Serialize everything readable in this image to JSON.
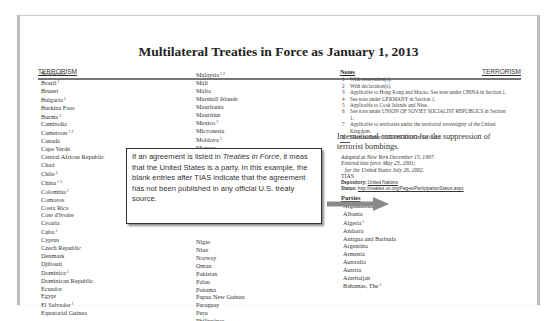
{
  "document": {
    "title": "Multilateral Treaties in Force as January 1, 2013",
    "running_head_left": "TERRORISM",
    "running_head_right": "TERRORISM"
  },
  "left_column": [
    {
      "name": "Botswana",
      "sup": ""
    },
    {
      "name": "Brazil",
      "sup": "1"
    },
    {
      "name": "Brunei",
      "sup": ""
    },
    {
      "name": "Bulgaria",
      "sup": "2"
    },
    {
      "name": "Burkina Faso",
      "sup": ""
    },
    {
      "name": "Burma",
      "sup": "1"
    },
    {
      "name": "Cambodia",
      "sup": ""
    },
    {
      "name": "Cameroon",
      "sup": "1 2"
    },
    {
      "name": "Canada",
      "sup": ""
    },
    {
      "name": "Cape Verde",
      "sup": ""
    },
    {
      "name": "Central African Republic",
      "sup": ""
    },
    {
      "name": "Chad",
      "sup": ""
    },
    {
      "name": "Chile",
      "sup": "2"
    },
    {
      "name": "China",
      "sup": "1 3"
    },
    {
      "name": "Colombia",
      "sup": "1"
    },
    {
      "name": "Comoros",
      "sup": ""
    },
    {
      "name": "Costa Rica",
      "sup": ""
    },
    {
      "name": "Cote d'Ivoire",
      "sup": ""
    },
    {
      "name": "Croatia",
      "sup": ""
    },
    {
      "name": "Cuba",
      "sup": "1"
    },
    {
      "name": "Cyprus",
      "sup": ""
    },
    {
      "name": "Czech Republic",
      "sup": ""
    },
    {
      "name": "Denmark",
      "sup": ""
    },
    {
      "name": "Djibouti",
      "sup": ""
    },
    {
      "name": "Dominica",
      "sup": "2"
    },
    {
      "name": "Dominican Republic",
      "sup": ""
    },
    {
      "name": "Ecuador",
      "sup": ""
    },
    {
      "name": "Egypt",
      "sup": ""
    },
    {
      "name": "El Salvador",
      "sup": "1"
    },
    {
      "name": "Equatorial Guinea",
      "sup": ""
    }
  ],
  "middle_column_top": [
    {
      "name": "Malaysia",
      "sup": "1 2"
    },
    {
      "name": "Mali",
      "sup": ""
    },
    {
      "name": "Malta",
      "sup": ""
    },
    {
      "name": "Marshall Islands",
      "sup": ""
    },
    {
      "name": "Mauritania",
      "sup": ""
    },
    {
      "name": "Mauritius",
      "sup": ""
    },
    {
      "name": "Mexico",
      "sup": "2"
    },
    {
      "name": "Micronesia",
      "sup": ""
    },
    {
      "name": "Moldova",
      "sup": "1"
    },
    {
      "name": "Monaco",
      "sup": ""
    }
  ],
  "middle_column_bottom": [
    {
      "name": "Niger",
      "sup": ""
    },
    {
      "name": "Niue",
      "sup": ""
    },
    {
      "name": "Norway",
      "sup": ""
    },
    {
      "name": "Oman",
      "sup": ""
    },
    {
      "name": "Pakistan",
      "sup": ""
    },
    {
      "name": "Palau",
      "sup": ""
    },
    {
      "name": "Panama",
      "sup": ""
    },
    {
      "name": "Papua New Guinea",
      "sup": ""
    },
    {
      "name": "Paraguay",
      "sup": ""
    },
    {
      "name": "Peru",
      "sup": ""
    },
    {
      "name": "Philippines",
      "sup": ""
    }
  ],
  "notes": {
    "heading": "Notes",
    "items": [
      {
        "num": "1",
        "text": "With reservation(s)."
      },
      {
        "num": "2",
        "text": "With declaration(s)."
      },
      {
        "num": "3",
        "text": "Applicable to Hong Kong and Macao. See note under CHINA in Section 1."
      },
      {
        "num": "4",
        "text": "See note under GERMANY in Section 1."
      },
      {
        "num": "5",
        "text": "Applicable to Cook Islands and Niue."
      },
      {
        "num": "6",
        "text": "See note under UNION OF SOVIET SOCIALIST REPUBLICS in Section 1."
      },
      {
        "num": "7",
        "text": "Applicable to territories under the territorial sovereignty of the United Kingdom."
      },
      {
        "num": "8",
        "text": "See note under YUGOSLAVIA in Section 1."
      }
    ]
  },
  "treaty": {
    "title": "International convention for the suppression of terrorist bombings.",
    "adopted": "Adopted at New York December 15, 1997.",
    "entered": "Entered into force May 23, 2001;",
    "entered_us": "for the United States July 26, 2002.",
    "tias": "TIAS",
    "depository_label": "Depository:",
    "depository_value": "United Nations",
    "status_label": "Status:",
    "status_value": "http://treaties.un.org/Pages/ParticipationStatus.aspx",
    "parties_heading": "Parties",
    "parties": [
      {
        "name": "Afghanistan",
        "sup": ""
      },
      {
        "name": "Albania",
        "sup": ""
      },
      {
        "name": "Algeria",
        "sup": "1"
      },
      {
        "name": "Andorra",
        "sup": ""
      },
      {
        "name": "Antigua and Barbuda",
        "sup": ""
      },
      {
        "name": "Argentina",
        "sup": ""
      },
      {
        "name": "Armenia",
        "sup": ""
      },
      {
        "name": "Australia",
        "sup": ""
      },
      {
        "name": "Austria",
        "sup": ""
      },
      {
        "name": "Azerbaijan",
        "sup": ""
      },
      {
        "name": "Bahamas, The",
        "sup": "1"
      }
    ]
  },
  "callout": {
    "part1": "If an agreement is listed in ",
    "italic": "Treaties in Force",
    "part2": ", it meas that the United States is a party.  In this example, the blank entries after TIAS indicate that the agreement has not been published in any official U.S. treaty source."
  },
  "colors": {
    "arrow": "#8a8a8a",
    "frame": "#bdbdbd",
    "callout_border": "#333333"
  }
}
